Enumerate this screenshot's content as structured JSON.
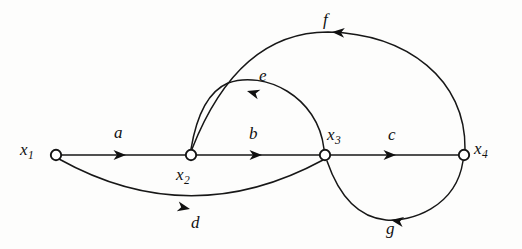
{
  "figure": {
    "type": "directed-graph-diagram",
    "background_color": "#fdfdfc",
    "stroke_color": "#171717",
    "node_fill_color": "#ffffff"
  },
  "nodes": [
    {
      "id": "x1",
      "label": "x",
      "subscript": "1",
      "x": 56,
      "y": 155,
      "r": 5.2,
      "label_x": 20,
      "label_y": 141
    },
    {
      "id": "x2",
      "label": "x",
      "subscript": "2",
      "x": 191,
      "y": 155,
      "r": 5.2,
      "label_x": 176,
      "label_y": 166
    },
    {
      "id": "x3",
      "label": "x",
      "subscript": "3",
      "x": 325,
      "y": 155,
      "r": 5.2,
      "label_x": 327,
      "label_y": 126
    },
    {
      "id": "x4",
      "label": "x",
      "subscript": "4",
      "x": 464,
      "y": 155,
      "r": 5.2,
      "label_x": 474,
      "label_y": 140
    }
  ],
  "edges": [
    {
      "id": "a",
      "label": "a",
      "from": "x1",
      "to": "x2",
      "shape": "straight",
      "path": "M 61.5 155 L 185.5 155",
      "arrow_x": 126,
      "arrow_y": 155,
      "arrow_angle": 0,
      "label_x": 114,
      "label_y": 124
    },
    {
      "id": "b",
      "label": "b",
      "from": "x2",
      "to": "x3",
      "shape": "straight",
      "path": "M 196.5 155 L 319.5 155",
      "arrow_x": 262,
      "arrow_y": 155,
      "arrow_angle": 0,
      "label_x": 249,
      "label_y": 125
    },
    {
      "id": "c",
      "label": "c",
      "from": "x3",
      "to": "x4",
      "shape": "straight",
      "path": "M 330.5 155 L 458.5 155",
      "arrow_x": 396,
      "arrow_y": 155,
      "arrow_angle": 0,
      "label_x": 388,
      "label_y": 126
    },
    {
      "id": "d",
      "label": "d",
      "from": "x1",
      "to": "x3",
      "shape": "arc-below",
      "path": "M 59 159 Q 190 232 323 160",
      "arrow_x": 190,
      "arrow_y": 209,
      "arrow_angle": 12,
      "label_x": 191,
      "label_y": 214
    },
    {
      "id": "e",
      "label": "e",
      "from": "x3",
      "to": "x2",
      "shape": "arc-above",
      "path": "M 324 149 C 318 96 264 70 228 83 Q 200 95 191 149",
      "arrow_x": 247,
      "arrow_y": 91,
      "arrow_angle": 196,
      "label_x": 259,
      "label_y": 67
    },
    {
      "id": "f",
      "label": "f",
      "from": "x4",
      "to": "x2",
      "shape": "arc-above",
      "path": "M 465 149 C 466 80 408 34 328 32 Q 238 32 192 149",
      "arrow_x": 332,
      "arrow_y": 32,
      "arrow_angle": 184,
      "label_x": 323,
      "label_y": 11
    },
    {
      "id": "g",
      "label": "g",
      "from": "x4",
      "to": "x3",
      "shape": "arc-below",
      "path": "M 463 161 C 456 208 410 222 386 220 Q 346 216 327 161",
      "arrow_x": 391,
      "arrow_y": 220,
      "arrow_angle": 189,
      "label_x": 386,
      "label_y": 220
    }
  ]
}
